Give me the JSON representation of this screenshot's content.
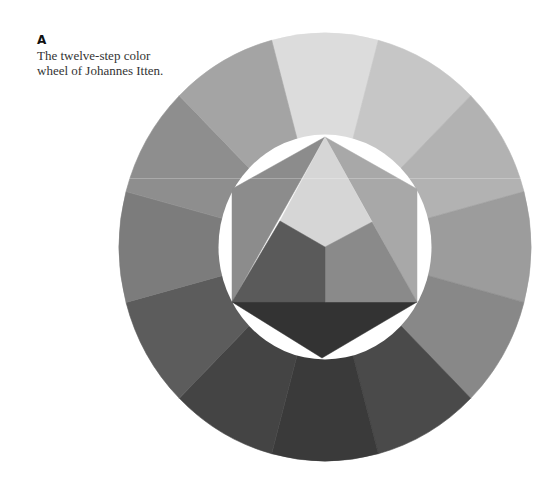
{
  "caption": {
    "label": "A",
    "lines": [
      "The twelve-step color",
      "wheel of Johannes Itten."
    ]
  },
  "wheel": {
    "center": [
      325,
      247
    ],
    "outer_radius": [
      206,
      214
    ],
    "inner_radius": [
      106.5,
      112.5
    ],
    "segments": [
      {
        "name": "yellow",
        "angle": 0,
        "gray": "#dcdcdc"
      },
      {
        "name": "yellow-orange",
        "angle": 30,
        "gray": "#c6c6c6"
      },
      {
        "name": "orange",
        "angle": 60,
        "gray": "#b2b2b2"
      },
      {
        "name": "red-orange",
        "angle": 90,
        "gray": "#9c9c9c"
      },
      {
        "name": "red",
        "angle": 120,
        "gray": "#888888"
      },
      {
        "name": "red-violet",
        "angle": 150,
        "gray": "#4a4a4a"
      },
      {
        "name": "violet",
        "angle": 180,
        "gray": "#3a3a3a"
      },
      {
        "name": "blue-violet",
        "angle": 210,
        "gray": "#444444"
      },
      {
        "name": "blue",
        "angle": 240,
        "gray": "#5c5c5c"
      },
      {
        "name": "blue-green",
        "angle": 270,
        "gray": "#7c7c7c"
      },
      {
        "name": "green",
        "angle": 300,
        "gray": "#8e8e8e"
      },
      {
        "name": "yellow-green",
        "angle": 330,
        "gray": "#a4a4a4"
      }
    ]
  },
  "hexagon": {
    "vertices": {
      "top": [
        325,
        137
      ],
      "upper_right": [
        417,
        189
      ],
      "lower_right": [
        417,
        302
      ],
      "bottom": [
        322,
        358
      ],
      "lower_left": [
        232,
        302
      ],
      "upper_left": [
        232,
        189
      ]
    },
    "kite": {
      "left": [
        280,
        221
      ],
      "center": [
        325,
        247
      ],
      "right": [
        372,
        222
      ]
    },
    "pieces": [
      {
        "name": "yellow-primary",
        "gray": "#d6d6d6"
      },
      {
        "name": "red-primary",
        "gray": "#8a8a8a"
      },
      {
        "name": "blue-primary",
        "gray": "#5a5a5a"
      },
      {
        "name": "orange-secondary",
        "gray": "#a8a8a8"
      },
      {
        "name": "green-secondary",
        "gray": "#8c8c8c"
      },
      {
        "name": "violet-secondary",
        "gray": "#333333"
      }
    ]
  }
}
